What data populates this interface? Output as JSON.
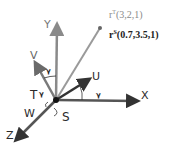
{
  "diagram": {
    "colors": {
      "axis_gray": "#8a8a8a",
      "axis_dark": "#333333",
      "vector_r": "#9a9a9a",
      "text_dark": "#222222",
      "text_light": "#8a8a8a"
    },
    "origin": {
      "x": 55,
      "y": 100
    },
    "axes": {
      "y": {
        "label": "Y"
      },
      "x": {
        "label": "X"
      },
      "z": {
        "label": "Z"
      }
    },
    "rotated_axes": {
      "u": {
        "label": "U"
      },
      "v": {
        "label": "V"
      },
      "w": {
        "label": "W"
      }
    },
    "rotations": {
      "t": {
        "label": "T"
      },
      "s": {
        "label": "S"
      }
    },
    "angle_symbol": "γ",
    "vectors": {
      "r_T": {
        "base": "r",
        "sup": "T",
        "coords": "(3,2,1)"
      },
      "r_S": {
        "base": "r",
        "sup": "S",
        "coords": "(0.7,3.5,1)"
      }
    }
  }
}
